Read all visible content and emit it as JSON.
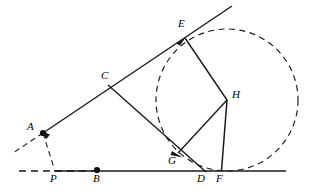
{
  "figure": {
    "type": "euclidean-geometry-diagram",
    "width": 314,
    "height": 195,
    "background_color": "#ffffff",
    "stroke_color": "#1a1a1a",
    "labels": {
      "A": "A",
      "B": "B",
      "C": "C",
      "D": "D",
      "E": "E",
      "F": "F",
      "G": "G",
      "H": "H",
      "P": "P"
    },
    "points": [
      {
        "name": "A",
        "x": 43,
        "y": 133,
        "marker": "filled-dot",
        "label": "A",
        "label_x": 28,
        "label_y": 122
      },
      {
        "name": "P",
        "x": 54,
        "y": 167,
        "marker": "none",
        "label": "P",
        "label_x": 50,
        "label_y": 174
      },
      {
        "name": "B",
        "x": 97,
        "y": 170,
        "marker": "filled-dot",
        "label": "B",
        "label_x": 93,
        "label_y": 174
      },
      {
        "name": "C",
        "x": 108,
        "y": 85,
        "marker": "none",
        "label": "C",
        "label_x": 101,
        "label_y": 71
      },
      {
        "name": "E",
        "x": 185,
        "y": 38,
        "marker": "none",
        "label": "E",
        "label_x": 178,
        "label_y": 20
      },
      {
        "name": "G",
        "x": 178,
        "y": 153,
        "marker": "none",
        "label": "G",
        "label_x": 170,
        "label_y": 157
      },
      {
        "name": "H",
        "x": 227,
        "y": 100,
        "marker": "none",
        "label": "H",
        "label_x": 232,
        "label_y": 90
      },
      {
        "name": "D",
        "x": 203,
        "y": 171,
        "marker": "none",
        "label": "D",
        "label_x": 197,
        "label_y": 174
      },
      {
        "name": "F",
        "x": 221,
        "y": 171,
        "marker": "none",
        "label": "F",
        "label_x": 216,
        "label_y": 174
      }
    ],
    "solid_segments": [
      {
        "name": "ray-A-through-E",
        "x1": 43,
        "y1": 133,
        "x2": 232,
        "y2": 6
      },
      {
        "name": "baseline-B-to-right",
        "x1": 54,
        "y1": 171,
        "x2": 286,
        "y2": 171
      },
      {
        "name": "segment-E-H",
        "x1": 185,
        "y1": 38,
        "x2": 227,
        "y2": 100
      },
      {
        "name": "segment-H-G",
        "x1": 227,
        "y1": 100,
        "x2": 178,
        "y2": 153
      },
      {
        "name": "segment-H-F",
        "x1": 227,
        "y1": 100,
        "x2": 221,
        "y2": 171
      },
      {
        "name": "segment-C-to-D",
        "x1": 108,
        "y1": 85,
        "x2": 205,
        "y2": 172
      }
    ],
    "dashed_segments": [
      {
        "name": "dashed-ray-left-of-A",
        "x1": 43,
        "y1": 133,
        "x2": 13,
        "y2": 153
      },
      {
        "name": "dashed-A-to-P",
        "x1": 43,
        "y1": 133,
        "x2": 54,
        "y2": 168
      },
      {
        "name": "dashed-baseline-left",
        "x1": 19,
        "y1": 171,
        "x2": 100,
        "y2": 171
      }
    ],
    "dashed_circle": {
      "name": "dashed-circle-centered-at-H",
      "cx": 227,
      "cy": 100,
      "r": 71,
      "tangent_point": "F"
    },
    "arrows": [
      {
        "name": "arrow-toward-E-on-ray-A-E",
        "x": 185,
        "y": 38,
        "angle_deg": -34
      },
      {
        "name": "arrow-toward-G-on-C-D",
        "x": 180,
        "y": 155,
        "angle_deg": 42
      },
      {
        "name": "arrow-toward-A-on-dashed",
        "x": 47,
        "y": 138,
        "angle_deg": 110
      }
    ]
  }
}
